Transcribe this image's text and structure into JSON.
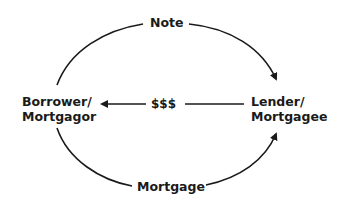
{
  "diagram": {
    "nodes": {
      "borrower": {
        "line1": "Borrower/",
        "line2": "Mortgagor"
      },
      "lender": {
        "line1": "Lender/",
        "line2": "Mortgagee"
      }
    },
    "edges": {
      "top": {
        "label": "Note",
        "from": "borrower",
        "to": "lender"
      },
      "middle": {
        "label": "$$$",
        "from": "lender",
        "to": "borrower"
      },
      "bottom": {
        "label": "Mortgage",
        "from": "borrower",
        "to": "lender"
      }
    },
    "colors": {
      "line": "#1a1a1a",
      "background": "#ffffff"
    }
  }
}
